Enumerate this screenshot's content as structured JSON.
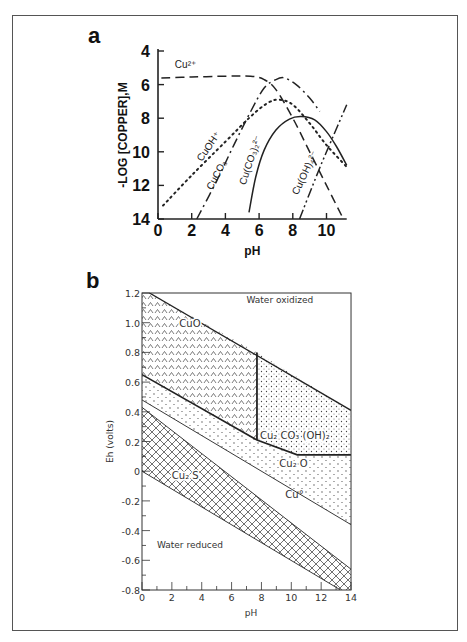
{
  "figure": {
    "panel_a_label": "a",
    "panel_b_label": "b"
  },
  "chart_data": [
    {
      "type": "line",
      "panel": "a",
      "title": "",
      "xlabel": "pH",
      "ylabel": "-LOG [COPPER],M",
      "xlim": [
        0,
        11.2
      ],
      "ylim": [
        14,
        4
      ],
      "y_inverted": true,
      "x_ticks": [
        "0",
        "2",
        "4",
        "6",
        "8",
        "10"
      ],
      "y_ticks": [
        "4",
        "6",
        "8",
        "10",
        "12",
        "14"
      ],
      "grid": false,
      "legend": "inline labels",
      "series": [
        {
          "name": "Cu2+",
          "label": "Cu²⁺",
          "style": "dashed",
          "points": [
            [
              0.2,
              5.6
            ],
            [
              2,
              5.55
            ],
            [
              4,
              5.5
            ],
            [
              5.5,
              5.5
            ],
            [
              6.3,
              5.7
            ],
            [
              7,
              6.3
            ],
            [
              8,
              8.0
            ],
            [
              9,
              10.0
            ],
            [
              10,
              12.0
            ],
            [
              11,
              14.0
            ]
          ]
        },
        {
          "name": "CuOH+",
          "label": "CuOH⁺",
          "style": "dotted",
          "points": [
            [
              0.3,
              13.2
            ],
            [
              2,
              11.4
            ],
            [
              4,
              9.4
            ],
            [
              5.5,
              7.9
            ],
            [
              6.5,
              7.1
            ],
            [
              7.2,
              6.9
            ],
            [
              8,
              7.2
            ],
            [
              9,
              8.3
            ],
            [
              10,
              9.6
            ],
            [
              11.2,
              10.9
            ]
          ]
        },
        {
          "name": "CuCO3",
          "label": "CuCO₃",
          "style": "dash-dot",
          "points": [
            [
              2.3,
              14.0
            ],
            [
              3.5,
              11.7
            ],
            [
              4.5,
              9.6
            ],
            [
              5.5,
              7.6
            ],
            [
              6.3,
              6.2
            ],
            [
              7.0,
              5.7
            ],
            [
              7.5,
              5.6
            ],
            [
              8.2,
              6.0
            ],
            [
              9.0,
              6.8
            ],
            [
              9.6,
              7.6
            ]
          ]
        },
        {
          "name": "Cu(CO3)2 2-",
          "label": "Cu(CO₃)₂²⁻",
          "style": "solid",
          "points": [
            [
              5.4,
              13.6
            ],
            [
              5.8,
              11.5
            ],
            [
              6.3,
              9.9
            ],
            [
              7,
              8.7
            ],
            [
              7.8,
              8.05
            ],
            [
              8.5,
              7.9
            ],
            [
              9.3,
              8.1
            ],
            [
              10,
              8.8
            ],
            [
              10.6,
              9.7
            ],
            [
              11.2,
              10.8
            ]
          ]
        },
        {
          "name": "Cu(OH)4 2-",
          "label": "Cu(OH)₄²⁻",
          "style": "dash-dot-dot",
          "points": [
            [
              8.4,
              14.0
            ],
            [
              9.5,
              11.2
            ],
            [
              10.3,
              9.3
            ],
            [
              11.2,
              7.2
            ]
          ]
        }
      ]
    },
    {
      "type": "area",
      "panel": "b",
      "title": "",
      "xlabel": "pH",
      "ylabel": "Eh (volts)",
      "xlim": [
        0,
        14
      ],
      "ylim": [
        -0.8,
        1.2
      ],
      "x_ticks": [
        "0",
        "2",
        "4",
        "6",
        "8",
        "10",
        "12",
        "14"
      ],
      "y_ticks": [
        "1.2",
        "1.0",
        "0.8",
        "0.6",
        "0.4",
        "0.2",
        "0",
        "-0.2",
        "-0.4",
        "-0.6",
        "-0.8"
      ],
      "grid": false,
      "regions": [
        {
          "name": "Water oxidized",
          "label": "Water oxidized",
          "fill": "none"
        },
        {
          "name": "CuO",
          "label": "CuO",
          "fill": "caret-pattern",
          "polygon": [
            [
              0,
              1.2
            ],
            [
              0.5,
              1.2
            ],
            [
              7.7,
              0.8
            ],
            [
              7.7,
              0.21
            ],
            [
              0,
              0.65
            ]
          ]
        },
        {
          "name": "Cu2CO3(OH)2",
          "label": "Cu₂ CO₃ (OH)₂",
          "fill": "dense-dots",
          "polygon": [
            [
              7.7,
              0.8
            ],
            [
              14,
              0.41
            ],
            [
              14,
              0.11
            ],
            [
              10.4,
              0.11
            ],
            [
              7.7,
              0.21
            ]
          ]
        },
        {
          "name": "Cu2O",
          "label": "Cu₂ O",
          "fill": "sparse-dots",
          "polygon": [
            [
              0,
              0.65
            ],
            [
              7.7,
              0.21
            ],
            [
              10.4,
              0.11
            ],
            [
              14,
              0.11
            ],
            [
              14,
              -0.36
            ],
            [
              0,
              0.48
            ]
          ]
        },
        {
          "name": "Cu0",
          "label": "Cu°",
          "fill": "none",
          "polygon": [
            [
              0,
              0.48
            ],
            [
              14,
              -0.36
            ],
            [
              14,
              -0.66
            ],
            [
              0,
              0.43
            ]
          ]
        },
        {
          "name": "Cu2S",
          "label": "Cu₂ S",
          "fill": "crosshatch",
          "polygon": [
            [
              0,
              0.43
            ],
            [
              14,
              -0.66
            ],
            [
              14,
              -0.8
            ],
            [
              13.3,
              -0.8
            ],
            [
              0,
              0.0
            ]
          ]
        },
        {
          "name": "Water reduced",
          "label": "Water reduced",
          "fill": "none"
        }
      ],
      "boundaries": [
        {
          "name": "water-oxidation",
          "points": [
            [
              0.5,
              1.2
            ],
            [
              14,
              0.41
            ]
          ]
        },
        {
          "name": "water-reduction",
          "points": [
            [
              0,
              0.0
            ],
            [
              13.3,
              -0.8
            ]
          ]
        },
        {
          "name": "CuO/Cu2CO3 vertical",
          "points": [
            [
              7.7,
              0.8
            ],
            [
              7.7,
              0.21
            ]
          ]
        },
        {
          "name": "Cu2O upper",
          "points": [
            [
              0,
              0.65
            ],
            [
              7.7,
              0.21
            ],
            [
              10.4,
              0.11
            ],
            [
              14,
              0.11
            ]
          ]
        },
        {
          "name": "Cu2O/Cu",
          "points": [
            [
              0,
              0.48
            ],
            [
              14,
              -0.36
            ]
          ]
        },
        {
          "name": "Cu/Cu2S",
          "points": [
            [
              0,
              0.43
            ],
            [
              14,
              -0.66
            ]
          ]
        }
      ]
    }
  ]
}
